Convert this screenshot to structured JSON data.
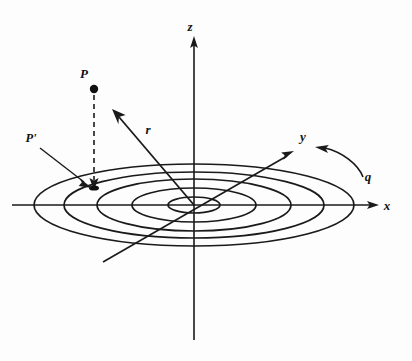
{
  "figure": {
    "type": "physics-diagram",
    "background_color": "#fdfdfd",
    "ink_color": "#1a1a1a"
  },
  "axes": [
    {
      "name": "z",
      "label": "z",
      "label_x": 194,
      "label_y": 30,
      "orientation": "vertical-up"
    },
    {
      "name": "x",
      "label": "x",
      "label_x": 387,
      "label_y": 209,
      "orientation": "horizontal-right"
    },
    {
      "name": "y",
      "label": "y",
      "label_x": 301,
      "label_y": 140,
      "orientation": "diagonal-up-right"
    }
  ],
  "origin": {
    "x": 194,
    "y": 205
  },
  "points": [
    {
      "name": "P",
      "label": "P",
      "dot_x": 94,
      "dot_y": 89,
      "label_x": 82,
      "label_y": 77,
      "dot_radius": 4.2
    },
    {
      "name": "P-prime",
      "label": "P'",
      "target_x": 94,
      "target_y": 188,
      "label_x": 26,
      "label_y": 141
    }
  ],
  "vectors": [
    {
      "name": "r",
      "label": "r",
      "label_x": 146,
      "label_y": 133,
      "from_x": 194,
      "from_y": 205,
      "to_x": 113,
      "to_y": 110
    },
    {
      "name": "q",
      "label": "q",
      "label_x": 366,
      "label_y": 179,
      "arc": "clockwise-rotation-indicator"
    }
  ],
  "rings": {
    "name": "concentric-ellipses",
    "count": 5,
    "center_x": 194,
    "center_y": 205,
    "semi_axes": [
      {
        "rx": 26,
        "ry": 8
      },
      {
        "rx": 62,
        "ry": 17
      },
      {
        "rx": 97,
        "ry": 26
      },
      {
        "rx": 130,
        "ry": 33
      },
      {
        "rx": 160,
        "ry": 41
      }
    ]
  },
  "extents": {
    "x_axis_left": 12,
    "x_axis_right": 377,
    "z_axis_top": 38,
    "z_axis_bottom": 340,
    "y_axis_tip_x": 292,
    "y_axis_tip_y": 152,
    "y_axis_tail_x": 103,
    "y_axis_tail_y": 262
  }
}
